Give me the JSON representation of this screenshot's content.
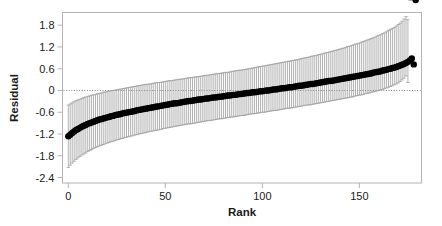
{
  "chart_data": {
    "type": "scatter",
    "title": "",
    "xlabel": "Rank",
    "ylabel": "Residual",
    "xlim": [
      -3,
      182
    ],
    "ylim": [
      -2.55,
      2.15
    ],
    "xticks": [
      0,
      50,
      100,
      150
    ],
    "xtick_labels": [
      "0",
      "50",
      "100",
      "150"
    ],
    "yticks": [
      1.8,
      1.2,
      0.6,
      0,
      -0.6,
      -1.2,
      -1.8,
      -2.4
    ],
    "ytick_labels": [
      "1.8",
      "1.2",
      "0.6",
      "0",
      "-0.6",
      "-1.2",
      "-1.8",
      "-2.4"
    ],
    "grid": false,
    "legend": null,
    "reference_lines": [
      {
        "name": "zero-line",
        "orientation": "horizontal",
        "value": 0,
        "style": "dotted",
        "color": "#808080"
      }
    ],
    "frame_color": "#b4b4b4",
    "marker_color": "#000000",
    "errorbar_color": "#9a9a9a",
    "marker_size": 3.2,
    "n_points": 180,
    "x": [
      0,
      1,
      2,
      3,
      4,
      5,
      6,
      7,
      8,
      9,
      10,
      11,
      12,
      13,
      14,
      15,
      16,
      17,
      18,
      19,
      20,
      21,
      22,
      23,
      24,
      25,
      26,
      27,
      28,
      29,
      30,
      31,
      32,
      33,
      34,
      35,
      36,
      37,
      38,
      39,
      40,
      41,
      42,
      43,
      44,
      45,
      46,
      47,
      48,
      49,
      50,
      51,
      52,
      53,
      54,
      55,
      56,
      57,
      58,
      59,
      60,
      61,
      62,
      63,
      64,
      65,
      66,
      67,
      68,
      69,
      70,
      71,
      72,
      73,
      74,
      75,
      76,
      77,
      78,
      79,
      80,
      81,
      82,
      83,
      84,
      85,
      86,
      87,
      88,
      89,
      90,
      91,
      92,
      93,
      94,
      95,
      96,
      97,
      98,
      99,
      100,
      101,
      102,
      103,
      104,
      105,
      106,
      107,
      108,
      109,
      110,
      111,
      112,
      113,
      114,
      115,
      116,
      117,
      118,
      119,
      120,
      121,
      122,
      123,
      124,
      125,
      126,
      127,
      128,
      129,
      130,
      131,
      132,
      133,
      134,
      135,
      136,
      137,
      138,
      139,
      140,
      141,
      142,
      143,
      144,
      145,
      146,
      147,
      148,
      149,
      150,
      151,
      152,
      153,
      154,
      155,
      156,
      157,
      158,
      159,
      160,
      161,
      162,
      163,
      164,
      165,
      166,
      167,
      168,
      169,
      170,
      171,
      172,
      173,
      174,
      175,
      176,
      177,
      178,
      179
    ],
    "y": [
      -1.26,
      -1.22,
      -1.17,
      -1.13,
      -1.09,
      -1.06,
      -1.03,
      -1.0,
      -0.97,
      -0.95,
      -0.92,
      -0.9,
      -0.88,
      -0.86,
      -0.84,
      -0.82,
      -0.8,
      -0.79,
      -0.77,
      -0.76,
      -0.74,
      -0.73,
      -0.71,
      -0.7,
      -0.68,
      -0.67,
      -0.66,
      -0.65,
      -0.63,
      -0.62,
      -0.61,
      -0.6,
      -0.59,
      -0.58,
      -0.57,
      -0.55,
      -0.54,
      -0.53,
      -0.52,
      -0.51,
      -0.5,
      -0.49,
      -0.48,
      -0.47,
      -0.46,
      -0.45,
      -0.44,
      -0.43,
      -0.42,
      -0.41,
      -0.4,
      -0.39,
      -0.38,
      -0.37,
      -0.36,
      -0.35,
      -0.35,
      -0.34,
      -0.33,
      -0.32,
      -0.31,
      -0.3,
      -0.29,
      -0.29,
      -0.28,
      -0.27,
      -0.26,
      -0.25,
      -0.25,
      -0.24,
      -0.23,
      -0.22,
      -0.22,
      -0.21,
      -0.2,
      -0.19,
      -0.19,
      -0.18,
      -0.17,
      -0.17,
      -0.16,
      -0.15,
      -0.14,
      -0.14,
      -0.13,
      -0.12,
      -0.12,
      -0.11,
      -0.1,
      -0.1,
      -0.09,
      -0.08,
      -0.07,
      -0.07,
      -0.06,
      -0.05,
      -0.05,
      -0.04,
      -0.03,
      -0.02,
      -0.02,
      -0.01,
      0.0,
      0.0,
      0.01,
      0.02,
      0.03,
      0.03,
      0.04,
      0.05,
      0.06,
      0.06,
      0.07,
      0.08,
      0.09,
      0.09,
      0.1,
      0.11,
      0.12,
      0.13,
      0.13,
      0.14,
      0.15,
      0.16,
      0.17,
      0.18,
      0.18,
      0.19,
      0.2,
      0.21,
      0.22,
      0.23,
      0.24,
      0.25,
      0.26,
      0.26,
      0.27,
      0.28,
      0.29,
      0.3,
      0.31,
      0.32,
      0.33,
      0.34,
      0.35,
      0.36,
      0.37,
      0.38,
      0.39,
      0.4,
      0.41,
      0.42,
      0.43,
      0.44,
      0.45,
      0.46,
      0.47,
      0.49,
      0.5,
      0.51,
      0.52,
      0.53,
      0.55,
      0.56,
      0.57,
      0.59,
      0.6,
      0.62,
      0.63,
      0.65,
      0.67,
      0.69,
      0.71,
      0.73,
      0.76,
      0.79,
      0.83,
      0.88,
      0.72
    ],
    "yerr_lower": [
      -2.12,
      -2.06,
      -2.0,
      -1.95,
      -1.9,
      -1.86,
      -1.82,
      -1.78,
      -1.75,
      -1.72,
      -1.68,
      -1.65,
      -1.63,
      -1.6,
      -1.57,
      -1.55,
      -1.53,
      -1.51,
      -1.49,
      -1.47,
      -1.45,
      -1.43,
      -1.41,
      -1.4,
      -1.38,
      -1.36,
      -1.35,
      -1.33,
      -1.32,
      -1.3,
      -1.29,
      -1.27,
      -1.26,
      -1.25,
      -1.23,
      -1.22,
      -1.21,
      -1.19,
      -1.18,
      -1.17,
      -1.16,
      -1.14,
      -1.13,
      -1.12,
      -1.11,
      -1.1,
      -1.09,
      -1.08,
      -1.07,
      -1.05,
      -1.04,
      -1.03,
      -1.02,
      -1.01,
      -1.0,
      -0.99,
      -0.98,
      -0.97,
      -0.96,
      -0.95,
      -0.94,
      -0.93,
      -0.92,
      -0.92,
      -0.91,
      -0.9,
      -0.89,
      -0.88,
      -0.87,
      -0.86,
      -0.85,
      -0.84,
      -0.83,
      -0.83,
      -0.82,
      -0.81,
      -0.8,
      -0.79,
      -0.78,
      -0.78,
      -0.77,
      -0.76,
      -0.75,
      -0.74,
      -0.73,
      -0.73,
      -0.72,
      -0.71,
      -0.7,
      -0.69,
      -0.69,
      -0.68,
      -0.67,
      -0.66,
      -0.65,
      -0.64,
      -0.64,
      -0.63,
      -0.62,
      -0.61,
      -0.6,
      -0.6,
      -0.59,
      -0.58,
      -0.57,
      -0.56,
      -0.55,
      -0.55,
      -0.54,
      -0.53,
      -0.52,
      -0.51,
      -0.5,
      -0.49,
      -0.49,
      -0.48,
      -0.47,
      -0.46,
      -0.45,
      -0.44,
      -0.43,
      -0.42,
      -0.41,
      -0.4,
      -0.4,
      -0.39,
      -0.38,
      -0.37,
      -0.36,
      -0.35,
      -0.34,
      -0.33,
      -0.32,
      -0.31,
      -0.3,
      -0.29,
      -0.28,
      -0.27,
      -0.26,
      -0.25,
      -0.24,
      -0.23,
      -0.22,
      -0.21,
      -0.2,
      -0.19,
      -0.18,
      -0.17,
      -0.15,
      -0.14,
      -0.13,
      -0.12,
      -0.11,
      -0.09,
      -0.08,
      -0.07,
      -0.05,
      -0.04,
      -0.03,
      -0.01,
      0.0,
      0.02,
      0.03,
      0.05,
      0.07,
      0.09,
      0.11,
      0.13,
      0.16,
      0.18,
      0.21,
      0.25,
      0.29,
      0.34,
      0.4,
      0.22
    ],
    "yerr_upper": [
      -0.4,
      -0.37,
      -0.34,
      -0.31,
      -0.28,
      -0.26,
      -0.24,
      -0.22,
      -0.2,
      -0.18,
      -0.16,
      -0.15,
      -0.13,
      -0.12,
      -0.11,
      -0.09,
      -0.08,
      -0.07,
      -0.05,
      -0.04,
      -0.03,
      -0.02,
      -0.01,
      0.0,
      0.01,
      0.02,
      0.03,
      0.04,
      0.05,
      0.06,
      0.07,
      0.08,
      0.09,
      0.1,
      0.11,
      0.12,
      0.13,
      0.14,
      0.15,
      0.16,
      0.17,
      0.17,
      0.18,
      0.19,
      0.2,
      0.21,
      0.22,
      0.22,
      0.23,
      0.24,
      0.25,
      0.26,
      0.27,
      0.27,
      0.28,
      0.29,
      0.3,
      0.31,
      0.31,
      0.32,
      0.33,
      0.34,
      0.35,
      0.35,
      0.36,
      0.37,
      0.38,
      0.38,
      0.39,
      0.4,
      0.41,
      0.42,
      0.42,
      0.43,
      0.44,
      0.45,
      0.46,
      0.46,
      0.47,
      0.48,
      0.49,
      0.5,
      0.5,
      0.51,
      0.52,
      0.53,
      0.54,
      0.55,
      0.56,
      0.56,
      0.57,
      0.58,
      0.59,
      0.6,
      0.61,
      0.62,
      0.63,
      0.64,
      0.65,
      0.66,
      0.67,
      0.68,
      0.69,
      0.7,
      0.71,
      0.72,
      0.73,
      0.74,
      0.75,
      0.76,
      0.77,
      0.78,
      0.79,
      0.8,
      0.81,
      0.82,
      0.83,
      0.84,
      0.85,
      0.86,
      0.88,
      0.89,
      0.9,
      0.91,
      0.92,
      0.94,
      0.95,
      0.96,
      0.97,
      0.99,
      1.0,
      1.01,
      1.03,
      1.04,
      1.05,
      1.07,
      1.08,
      1.1,
      1.11,
      1.13,
      1.14,
      1.16,
      1.17,
      1.19,
      1.21,
      1.22,
      1.24,
      1.26,
      1.28,
      1.29,
      1.31,
      1.33,
      1.35,
      1.37,
      1.39,
      1.41,
      1.43,
      1.45,
      1.47,
      1.5,
      1.52,
      1.54,
      1.57,
      1.59,
      1.62,
      1.65,
      1.68,
      1.71,
      1.74,
      1.78,
      1.82,
      1.86,
      1.91,
      1.97,
      2.04,
      1.95
    ]
  },
  "axes": {
    "x_title": "Rank",
    "y_title": "Residual"
  }
}
